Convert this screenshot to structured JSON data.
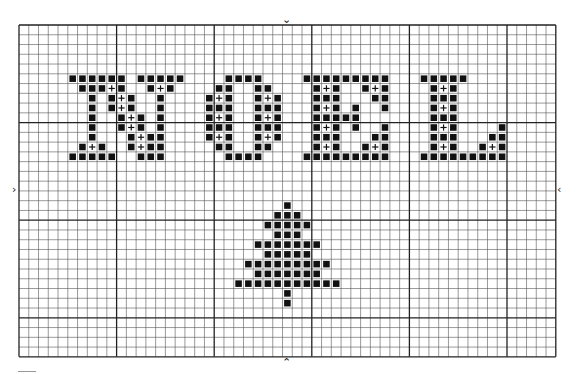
{
  "pattern": {
    "title": "NOEL",
    "grid": {
      "cols": 55,
      "rows": 34,
      "origin_x": 19,
      "origin_y": 25,
      "cell": 9.76,
      "major_every": 10,
      "line_color": "#555555",
      "major_line_color": "#222222"
    },
    "stitch_color": "#111111",
    "symbols": {
      "filled": "black-square",
      "plus": "+"
    },
    "center_markers": {
      "top": "⌄",
      "bottom": "⌃",
      "left": "›",
      "right": "‹"
    },
    "letters": [
      {
        "char": "N",
        "filled": [
          [
            5,
            5
          ],
          [
            6,
            5
          ],
          [
            7,
            5
          ],
          [
            8,
            5
          ],
          [
            9,
            5
          ],
          [
            10,
            5
          ],
          [
            12,
            5
          ],
          [
            13,
            5
          ],
          [
            14,
            5
          ],
          [
            15,
            5
          ],
          [
            16,
            5
          ],
          [
            6,
            6
          ],
          [
            7,
            6
          ],
          [
            8,
            6
          ],
          [
            10,
            6
          ],
          [
            13,
            6
          ],
          [
            15,
            6
          ],
          [
            7,
            7
          ],
          [
            9,
            7
          ],
          [
            11,
            7
          ],
          [
            14,
            7
          ],
          [
            7,
            8
          ],
          [
            9,
            8
          ],
          [
            11,
            8
          ],
          [
            14,
            8
          ],
          [
            7,
            9
          ],
          [
            10,
            9
          ],
          [
            12,
            9
          ],
          [
            14,
            9
          ],
          [
            7,
            10
          ],
          [
            10,
            10
          ],
          [
            12,
            10
          ],
          [
            14,
            10
          ],
          [
            7,
            11
          ],
          [
            11,
            11
          ],
          [
            13,
            11
          ],
          [
            14,
            11
          ],
          [
            6,
            12
          ],
          [
            8,
            12
          ],
          [
            11,
            12
          ],
          [
            13,
            12
          ],
          [
            14,
            12
          ],
          [
            5,
            13
          ],
          [
            6,
            13
          ],
          [
            7,
            13
          ],
          [
            8,
            13
          ],
          [
            9,
            13
          ],
          [
            12,
            13
          ],
          [
            13,
            13
          ],
          [
            14,
            13
          ]
        ],
        "plus": [
          [
            9,
            6
          ],
          [
            14,
            6
          ],
          [
            10,
            7
          ],
          [
            10,
            8
          ],
          [
            11,
            9
          ],
          [
            11,
            10
          ],
          [
            12,
            11
          ],
          [
            7,
            12
          ],
          [
            12,
            12
          ]
        ]
      },
      {
        "char": "O",
        "filled": [
          [
            21,
            5
          ],
          [
            22,
            5
          ],
          [
            23,
            5
          ],
          [
            24,
            5
          ],
          [
            20,
            6
          ],
          [
            21,
            6
          ],
          [
            24,
            6
          ],
          [
            25,
            6
          ],
          [
            19,
            7
          ],
          [
            21,
            7
          ],
          [
            24,
            7
          ],
          [
            26,
            7
          ],
          [
            19,
            8
          ],
          [
            20,
            8
          ],
          [
            21,
            8
          ],
          [
            24,
            8
          ],
          [
            25,
            8
          ],
          [
            26,
            8
          ],
          [
            19,
            9
          ],
          [
            21,
            9
          ],
          [
            24,
            9
          ],
          [
            26,
            9
          ],
          [
            19,
            10
          ],
          [
            20,
            10
          ],
          [
            21,
            10
          ],
          [
            24,
            10
          ],
          [
            25,
            10
          ],
          [
            26,
            10
          ],
          [
            19,
            11
          ],
          [
            21,
            11
          ],
          [
            24,
            11
          ],
          [
            26,
            11
          ],
          [
            20,
            12
          ],
          [
            21,
            12
          ],
          [
            24,
            12
          ],
          [
            25,
            12
          ],
          [
            21,
            13
          ],
          [
            22,
            13
          ],
          [
            23,
            13
          ],
          [
            24,
            13
          ]
        ],
        "plus": [
          [
            20,
            7
          ],
          [
            25,
            7
          ],
          [
            20,
            9
          ],
          [
            25,
            9
          ],
          [
            20,
            11
          ],
          [
            25,
            11
          ]
        ]
      },
      {
        "char": "E",
        "filled": [
          [
            29,
            5
          ],
          [
            30,
            5
          ],
          [
            31,
            5
          ],
          [
            32,
            5
          ],
          [
            33,
            5
          ],
          [
            34,
            5
          ],
          [
            35,
            5
          ],
          [
            36,
            5
          ],
          [
            37,
            5
          ],
          [
            30,
            6
          ],
          [
            32,
            6
          ],
          [
            35,
            6
          ],
          [
            37,
            6
          ],
          [
            30,
            7
          ],
          [
            31,
            7
          ],
          [
            32,
            7
          ],
          [
            36,
            7
          ],
          [
            37,
            7
          ],
          [
            30,
            8
          ],
          [
            32,
            8
          ],
          [
            34,
            8
          ],
          [
            37,
            8
          ],
          [
            30,
            9
          ],
          [
            31,
            9
          ],
          [
            32,
            9
          ],
          [
            33,
            9
          ],
          [
            34,
            9
          ],
          [
            30,
            10
          ],
          [
            32,
            10
          ],
          [
            34,
            10
          ],
          [
            37,
            10
          ],
          [
            30,
            11
          ],
          [
            31,
            11
          ],
          [
            32,
            11
          ],
          [
            36,
            11
          ],
          [
            37,
            11
          ],
          [
            30,
            12
          ],
          [
            32,
            12
          ],
          [
            35,
            12
          ],
          [
            37,
            12
          ],
          [
            29,
            13
          ],
          [
            30,
            13
          ],
          [
            31,
            13
          ],
          [
            32,
            13
          ],
          [
            33,
            13
          ],
          [
            34,
            13
          ],
          [
            35,
            13
          ],
          [
            36,
            13
          ],
          [
            37,
            13
          ]
        ],
        "plus": [
          [
            31,
            6
          ],
          [
            36,
            6
          ],
          [
            31,
            8
          ],
          [
            31,
            10
          ],
          [
            31,
            12
          ],
          [
            36,
            12
          ]
        ]
      },
      {
        "char": "L",
        "filled": [
          [
            41,
            5
          ],
          [
            42,
            5
          ],
          [
            43,
            5
          ],
          [
            44,
            5
          ],
          [
            45,
            5
          ],
          [
            42,
            6
          ],
          [
            44,
            6
          ],
          [
            42,
            7
          ],
          [
            43,
            7
          ],
          [
            44,
            7
          ],
          [
            42,
            8
          ],
          [
            44,
            8
          ],
          [
            42,
            9
          ],
          [
            43,
            9
          ],
          [
            44,
            9
          ],
          [
            42,
            10
          ],
          [
            44,
            10
          ],
          [
            49,
            10
          ],
          [
            42,
            11
          ],
          [
            43,
            11
          ],
          [
            44,
            11
          ],
          [
            48,
            11
          ],
          [
            49,
            11
          ],
          [
            42,
            12
          ],
          [
            44,
            12
          ],
          [
            47,
            12
          ],
          [
            49,
            12
          ],
          [
            41,
            13
          ],
          [
            42,
            13
          ],
          [
            43,
            13
          ],
          [
            44,
            13
          ],
          [
            45,
            13
          ],
          [
            46,
            13
          ],
          [
            47,
            13
          ],
          [
            48,
            13
          ],
          [
            49,
            13
          ]
        ],
        "plus": [
          [
            43,
            6
          ],
          [
            43,
            8
          ],
          [
            43,
            10
          ],
          [
            43,
            12
          ],
          [
            48,
            12
          ]
        ]
      }
    ],
    "tree": {
      "filled": [
        [
          27,
          18
        ],
        [
          26,
          19
        ],
        [
          27,
          19
        ],
        [
          28,
          19
        ],
        [
          25,
          20
        ],
        [
          26,
          20
        ],
        [
          27,
          20
        ],
        [
          28,
          20
        ],
        [
          29,
          20
        ],
        [
          26,
          21
        ],
        [
          27,
          21
        ],
        [
          28,
          21
        ],
        [
          24,
          22
        ],
        [
          25,
          22
        ],
        [
          26,
          22
        ],
        [
          27,
          22
        ],
        [
          28,
          22
        ],
        [
          29,
          22
        ],
        [
          30,
          22
        ],
        [
          25,
          23
        ],
        [
          26,
          23
        ],
        [
          27,
          23
        ],
        [
          28,
          23
        ],
        [
          29,
          23
        ],
        [
          23,
          24
        ],
        [
          24,
          24
        ],
        [
          25,
          24
        ],
        [
          26,
          24
        ],
        [
          27,
          24
        ],
        [
          28,
          24
        ],
        [
          29,
          24
        ],
        [
          30,
          24
        ],
        [
          31,
          24
        ],
        [
          24,
          25
        ],
        [
          25,
          25
        ],
        [
          26,
          25
        ],
        [
          27,
          25
        ],
        [
          28,
          25
        ],
        [
          29,
          25
        ],
        [
          30,
          25
        ],
        [
          22,
          26
        ],
        [
          23,
          26
        ],
        [
          24,
          26
        ],
        [
          25,
          26
        ],
        [
          26,
          26
        ],
        [
          27,
          26
        ],
        [
          28,
          26
        ],
        [
          29,
          26
        ],
        [
          30,
          26
        ],
        [
          31,
          26
        ],
        [
          32,
          26
        ],
        [
          27,
          27
        ],
        [
          27,
          28
        ]
      ]
    }
  }
}
